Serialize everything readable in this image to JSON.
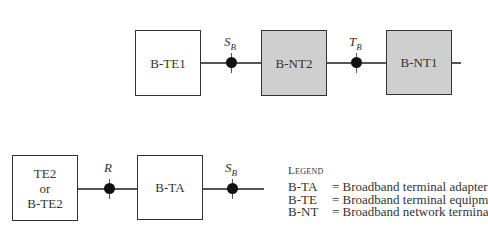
{
  "diagram": {
    "top_row": {
      "boxes": [
        {
          "id": "b-te1",
          "label": "B-TE1",
          "fill": "#ffffff"
        },
        {
          "id": "b-nt2",
          "label": "B-NT2",
          "fill": "#cfcfcf"
        },
        {
          "id": "b-nt1",
          "label": "B-NT1",
          "fill": "#cfcfcf"
        }
      ],
      "reference_points": [
        {
          "letter": "S",
          "subscript": "B"
        },
        {
          "letter": "T",
          "subscript": "B"
        }
      ]
    },
    "bottom_row": {
      "boxes": [
        {
          "id": "te2",
          "label_lines": [
            "TE2",
            "or",
            "B-TE2"
          ],
          "fill": "#ffffff"
        },
        {
          "id": "b-ta",
          "label": "B-TA",
          "fill": "#ffffff"
        }
      ],
      "reference_points": [
        {
          "letter": "R",
          "subscript": ""
        },
        {
          "letter": "S",
          "subscript": "B"
        }
      ]
    },
    "legend": {
      "title": "Legend",
      "entries": [
        {
          "abbr": "B-TA",
          "definition": "= Broadband terminal adapter"
        },
        {
          "abbr": "B-TE",
          "definition": "= Broadband terminal equipm"
        },
        {
          "abbr": "B-NT",
          "definition": "= Broadband network termina"
        }
      ]
    }
  }
}
